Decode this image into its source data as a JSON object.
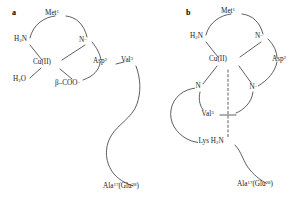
{
  "figure": {
    "type": "chemical-structure-diagram",
    "background": "#ffffff",
    "ink": "#1a1a1a",
    "panels": [
      {
        "tag": "a",
        "title": "",
        "labels": {
          "met1": "Met",
          "met1_sup": "1",
          "h2n": "H",
          "h2n_sub": "2",
          "h2n_tail": "N",
          "n_minus": "N",
          "n_minus_sup": "–",
          "cu": "Cu(II)",
          "h2o": "H",
          "h2o_sub": "2",
          "h2o_tail": "O",
          "beta_coo": "β–COO",
          "beta_coo_sup": "–",
          "asp2": "Asp",
          "asp2_sup": "2",
          "val3": "Val",
          "val3_sup": "3",
          "ala17": "Ala",
          "ala17_sup": "17",
          "glu28_open": "(Glu",
          "glu28_sup": "28",
          "glu28_close": ")"
        }
      },
      {
        "tag": "b",
        "title": "",
        "labels": {
          "met1": "Met",
          "met1_sup": "1",
          "h2n": "H",
          "h2n_sub": "2",
          "h2n_tail": "N",
          "n_minus_top": "N",
          "n_minus_top_sup": "–",
          "cu": "Cu(II)",
          "asp2": "Asp",
          "asp2_sup": "2",
          "n_left": "N",
          "n_right": "N",
          "n_right_sup": "–",
          "val3": "Val",
          "val3_sup": "3",
          "lys": "Lys H",
          "lys_sub": "2",
          "lys_tail": "N",
          "ala17": "Ala",
          "ala17_sup": "17",
          "glu28_open": "(Glu",
          "glu28_sup": "28",
          "glu28_close": ")"
        }
      }
    ]
  }
}
